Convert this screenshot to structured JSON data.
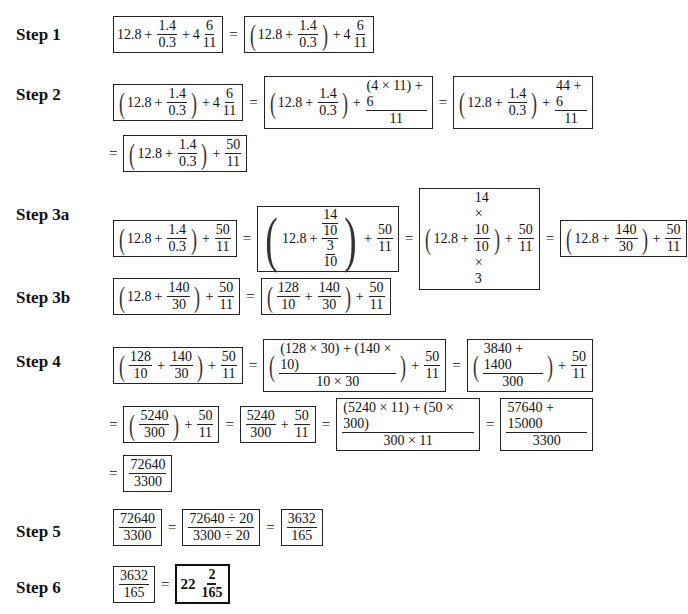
{
  "steps": [
    {
      "label": "Step 1"
    },
    {
      "label": "Step 2"
    },
    {
      "label": "Step 3a"
    },
    {
      "label": "Step 3b"
    },
    {
      "label": "Step 4"
    },
    {
      "label": "Step 5"
    },
    {
      "label": "Step 6"
    }
  ],
  "sym": {
    "eq": "=",
    "plus": "+",
    "lp": "(",
    "rp": ")"
  },
  "s1": {
    "a": "12.8",
    "n1": "1.4",
    "d1": "0.3",
    "w": "4",
    "n2": "6",
    "d2": "11"
  },
  "s2": {
    "a": "12.8",
    "n1": "1.4",
    "d1": "0.3",
    "w": "4",
    "n2": "6",
    "d2": "11",
    "n3": "(4 × 11) + 6",
    "d3": "11",
    "n4": "44 + 6",
    "d4": "11",
    "n5": "50",
    "d5": "11"
  },
  "s3a": {
    "a": "12.8",
    "n1": "1.4",
    "d1": "0.3",
    "n2": "50",
    "d2": "11",
    "cn_n": "14",
    "cn_d": "10",
    "cd_n": "3",
    "cd_d": "10",
    "n3": "14 × 10",
    "d3": "10 × 3",
    "n4": "140",
    "d4": "30"
  },
  "s3b": {
    "a": "12.8",
    "n1": "140",
    "d1": "30",
    "n2": "50",
    "d2": "11",
    "n3": "128",
    "d3": "10"
  },
  "s4": {
    "n1": "128",
    "d1": "10",
    "n2": "140",
    "d2": "30",
    "n3": "50",
    "d3": "11",
    "n4": "(128 × 30) + (140 × 10)",
    "d4": "10 × 30",
    "n5": "3840 + 1400",
    "d5": "300",
    "n6": "5240",
    "d6": "300",
    "n7": "(5240 × 11) + (50 × 300)",
    "d7": "300 × 11",
    "n8": "57640 + 15000",
    "d8": "3300",
    "n9": "72640",
    "d9": "3300"
  },
  "s5": {
    "n1": "72640",
    "d1": "3300",
    "n2": "72640 ÷ 20",
    "d2": "3300 ÷ 20",
    "n3": "3632",
    "d3": "165"
  },
  "s6": {
    "n1": "3632",
    "d1": "165",
    "w": "22",
    "n2": "2",
    "d2": "165"
  }
}
